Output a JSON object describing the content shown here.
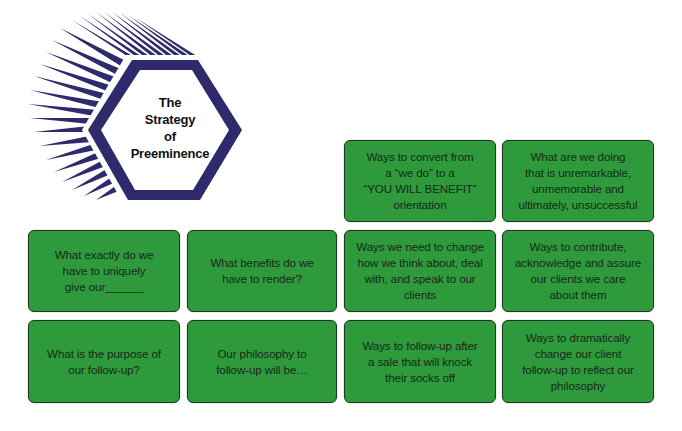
{
  "logo": {
    "title": "The\nStrategy\nof\nPreeminence",
    "icon": "hexagon-with-speed-lines-icon",
    "color": "#2e2a6b"
  },
  "colors": {
    "card_fill": "#2e9a3c",
    "card_border": "#1d3a20",
    "card_text": "#15291a",
    "logo_navy": "#2e2a6b",
    "background": "#ffffff"
  },
  "cards": {
    "row1": [
      {
        "text": "Ways to convert from\na “we do” to a\n“YOU WILL BENEFIT”\norientation"
      },
      {
        "text": "What are we doing\nthat is unremarkable,\nunmemorable and\nultimately, unsuccessful"
      }
    ],
    "row2": [
      {
        "text": "What exactly do we\nhave to uniquely\ngive our______"
      },
      {
        "text": "What benefits do we\nhave to render?"
      },
      {
        "text": "Ways we need to change\nhow we think about, deal\nwith, and speak to our\nclients"
      },
      {
        "text": "Ways to contribute,\nacknowledge and assure\nour clients we care\nabout them"
      }
    ],
    "row3": [
      {
        "text": "What is the purpose of\nour follow-up?"
      },
      {
        "text": "Our philosophy to\nfollow-up will be…"
      },
      {
        "text": "Ways to follow-up after\na sale that will knock\ntheir socks off"
      },
      {
        "text": "Ways to dramatically\nchange our client\nfollow-up to reflect our\nphilosophy"
      }
    ]
  }
}
